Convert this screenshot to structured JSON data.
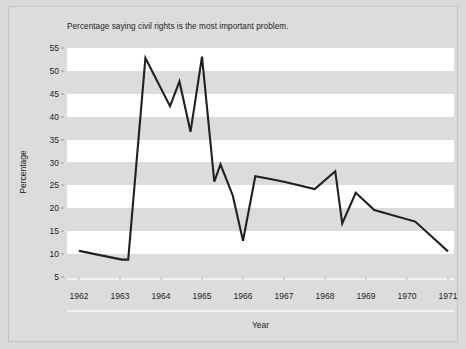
{
  "chart_data": {
    "type": "line",
    "title": "Percentage saying civil rights is the most important problem.",
    "xlabel": "Year",
    "ylabel": "Percentage",
    "ylim": [
      5,
      55
    ],
    "xlim": [
      1962,
      1971
    ],
    "grid": "horizontal-banding",
    "legend": "none",
    "line_color": "#231f20",
    "xticks": [
      "1962",
      "1963",
      "1964",
      "1965",
      "1966",
      "1967",
      "1968",
      "1969",
      "1970",
      "1971"
    ],
    "yticks": [
      "5",
      "10",
      "15",
      "20",
      "25",
      "30",
      "35",
      "40",
      "45",
      "50",
      "55"
    ],
    "series": [
      {
        "name": "Civil rights most important problem",
        "x": [
          1962.0,
          1963.05,
          1963.2,
          1963.62,
          1964.22,
          1964.45,
          1964.72,
          1965.0,
          1965.3,
          1965.45,
          1965.75,
          1966.0,
          1966.3,
          1966.6,
          1967.0,
          1967.75,
          1968.25,
          1968.42,
          1968.75,
          1969.2,
          1970.2,
          1971.0
        ],
        "values": [
          10.7,
          8.8,
          8.8,
          52.8,
          42.3,
          47.7,
          36.7,
          53.1,
          25.8,
          29.6,
          22.8,
          12.9,
          27.0,
          26.5,
          25.8,
          24.2,
          28.1,
          16.7,
          23.4,
          19.6,
          17.1,
          10.6
        ]
      }
    ]
  },
  "chart": {
    "title": "Percentage saying civil rights is the most important problem.",
    "y_axis_title": "Percentage",
    "x_axis_title": "Year"
  },
  "colors": {
    "figure_background": "#d9d9d9",
    "plot_background": "#dcdcdc",
    "band": "#ffffff",
    "line": "#231f20",
    "tick_text": "#232323"
  }
}
